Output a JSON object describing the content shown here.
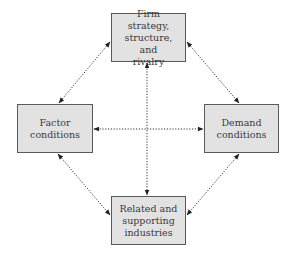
{
  "diagram": {
    "type": "porter-diamond",
    "nodes": {
      "top": "Firm strategy,\nstructure, and\nrivalry",
      "left": "Factor\nconditions",
      "right": "Demand\nconditions",
      "bottom": "Related and\nsupporting\nindustries"
    },
    "edges": [
      {
        "from": "top",
        "to": "left",
        "style": "dotted",
        "arrows": "both"
      },
      {
        "from": "top",
        "to": "right",
        "style": "dotted",
        "arrows": "both"
      },
      {
        "from": "top",
        "to": "bottom",
        "style": "dotted",
        "arrows": "both"
      },
      {
        "from": "left",
        "to": "right",
        "style": "dotted",
        "arrows": "both"
      },
      {
        "from": "left",
        "to": "bottom",
        "style": "dotted",
        "arrows": "both"
      },
      {
        "from": "right",
        "to": "bottom",
        "style": "dotted",
        "arrows": "both"
      }
    ],
    "colors": {
      "box_fill": "#e2e2e2",
      "box_border": "#5a5a5a",
      "text": "#3a3a3a",
      "arrow": "#222222"
    }
  }
}
